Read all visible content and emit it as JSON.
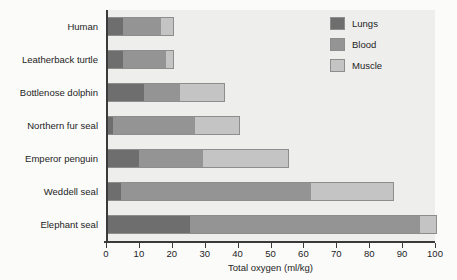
{
  "chart_data": {
    "type": "bar",
    "orientation": "horizontal",
    "stacked": true,
    "title": "",
    "xlabel": "Total oxygen (ml/kg)",
    "ylabel": "",
    "xlim": [
      0,
      100
    ],
    "xticks": [
      0,
      10,
      20,
      30,
      40,
      50,
      60,
      70,
      80,
      90,
      100
    ],
    "xtick_labels": [
      "0",
      "10",
      "20",
      "30",
      "40",
      "50",
      "60",
      "70",
      "80",
      "90",
      "100"
    ],
    "grid": false,
    "legend_position": "top-right",
    "categories": [
      "Human",
      "Leatherback turtle",
      "Bottlenose dolphin",
      "Northern fur seal",
      "Emperor penguin",
      "Weddell seal",
      "Elephant seal"
    ],
    "series": [
      {
        "name": "Lungs",
        "color": "#6e6e6e",
        "values": [
          4.5,
          4.5,
          11,
          1.5,
          9.5,
          4,
          25
        ]
      },
      {
        "name": "Blood",
        "color": "#949494",
        "values": [
          12,
          13.5,
          11,
          25,
          19.5,
          58,
          70
        ]
      },
      {
        "name": "Muscle",
        "color": "#c4c4c4",
        "values": [
          3.5,
          2,
          13.5,
          13.5,
          26,
          25,
          5
        ]
      }
    ],
    "totals": [
      20,
      20,
      35.5,
      40,
      55,
      87,
      100
    ]
  },
  "legend": {
    "items": [
      {
        "label": "Lungs",
        "swatch": "lungs-swatch"
      },
      {
        "label": "Blood",
        "swatch": "blood-swatch"
      },
      {
        "label": "Muscle",
        "swatch": "muscle-swatch"
      }
    ]
  }
}
